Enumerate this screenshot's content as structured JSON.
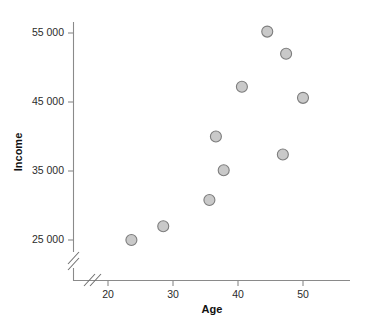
{
  "chart_data": {
    "type": "scatter",
    "title": "",
    "xlabel": "Age",
    "ylabel": "Income",
    "xlim": [
      15.6,
      54.5
    ],
    "ylim": [
      22000,
      57000
    ],
    "grid": false,
    "legend": "none",
    "axis_break": {
      "x": true,
      "y": true,
      "note": "double-slash break marks near origin on both axes"
    },
    "xticks": [
      20,
      30,
      40,
      50
    ],
    "xtick_labels": [
      "20",
      "30",
      "40",
      "50"
    ],
    "yticks": [
      25000,
      35000,
      45000,
      55000
    ],
    "ytick_labels": [
      "25 000",
      "35 000",
      "45 000",
      "55 000"
    ],
    "marker": {
      "shape": "circle",
      "fill": "#c9c9c9",
      "edge": "#7d7d7d",
      "size_px": 11
    },
    "points": [
      {
        "x": 23.6,
        "y": 25000
      },
      {
        "x": 28.5,
        "y": 27000
      },
      {
        "x": 35.6,
        "y": 30800
      },
      {
        "x": 36.6,
        "y": 40000
      },
      {
        "x": 37.8,
        "y": 35100
      },
      {
        "x": 40.6,
        "y": 47200
      },
      {
        "x": 44.5,
        "y": 55200
      },
      {
        "x": 47.4,
        "y": 52000
      },
      {
        "x": 46.9,
        "y": 37400
      },
      {
        "x": 50.0,
        "y": 45600
      }
    ]
  },
  "labels": {
    "x_axis_title": "Age",
    "y_axis_title": "Income",
    "x_tick_0": "20",
    "x_tick_1": "30",
    "x_tick_2": "40",
    "x_tick_3": "50",
    "y_tick_0": "25 000",
    "y_tick_1": "35 000",
    "y_tick_2": "45 000",
    "y_tick_3": "55 000"
  },
  "colors": {
    "marker_fill": "#c9c9c9",
    "marker_edge": "#7d7d7d",
    "axis": "#8a8a8a",
    "text": "#2b2b2b",
    "background": "#ffffff"
  }
}
